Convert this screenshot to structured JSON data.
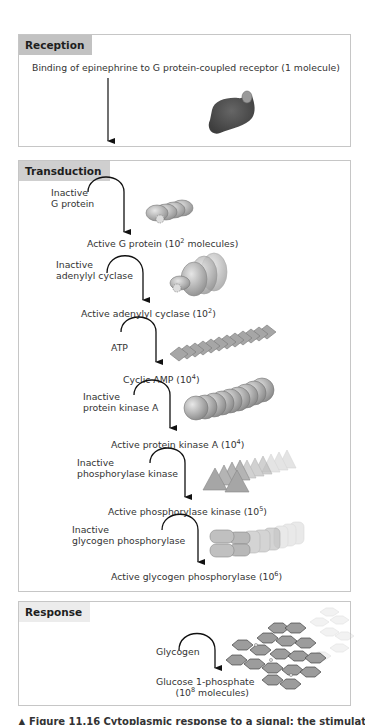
{
  "reception": {
    "header": "Reception",
    "description": "Binding of epinephrine to G protein-coupled receptor (1 molecule)"
  },
  "transduction": {
    "header": "Transduction",
    "steps": [
      {
        "input_line1": "Inactive",
        "input_line2": "G protein",
        "output": "Active G protein (10",
        "output_exp": "2",
        "output_suffix": " molecules)"
      },
      {
        "input_line1": "Inactive",
        "input_line2": "adenylyl cyclase",
        "output": "Active adenylyl cyclase (10",
        "output_exp": "2",
        "output_suffix": ")"
      },
      {
        "input_line1": "ATP",
        "input_line2": "",
        "output": "Cyclic AMP (10",
        "output_exp": "4",
        "output_suffix": ")"
      },
      {
        "input_line1": "Inactive",
        "input_line2": "protein kinase A",
        "output": "Active protein kinase A (10",
        "output_exp": "4",
        "output_suffix": ")"
      },
      {
        "input_line1": "Inactive",
        "input_line2": "phosphorylase kinase",
        "output": "Active phosphorylase kinase (10",
        "output_exp": "5",
        "output_suffix": ")"
      },
      {
        "input_line1": "Inactive",
        "input_line2": "glycogen phosphorylase",
        "output": "Active glycogen phosphorylase (10",
        "output_exp": "6",
        "output_suffix": ")"
      }
    ]
  },
  "response": {
    "header": "Response",
    "input": "Glycogen",
    "output_line1": "Glucose 1-phosphate",
    "output_line2_prefix": "(10",
    "output_line2_exp": "8",
    "output_line2_suffix": " molecules)"
  },
  "caption": {
    "marker": "▲",
    "figure_label": "Figure 11.16",
    "text": "Cytoplasmic response to a signal: the stimulation"
  },
  "colors": {
    "reception_header_bg": "#c2c2c2",
    "transduction_header_bg": "#cfcfcf",
    "response_header_bg": "#ececec",
    "panel_border": "#c6c6c6",
    "receptor_fill": "#5a5a5a",
    "molecule_fill": "#a8a8a8"
  }
}
